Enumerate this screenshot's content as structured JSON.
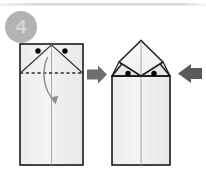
{
  "step": {
    "number": "4",
    "badge_color": "#b3b3b3",
    "badge_text_color": "#d6d6d6"
  },
  "page": {
    "background": "#ffffff",
    "rule_color": "#d8d9dd",
    "title": "Step 4 - fold top corners down"
  },
  "palette": {
    "paper_fill": "#f2f2f2",
    "paper_fill_light": "#fafafa",
    "paper_fill_shade": "#e8e8e8",
    "outline": "#1a1a1a",
    "crease": "#9a9a9a",
    "dash": "#3a3a3a",
    "dot": "#000000",
    "arrow_primary": "#6e6e6e",
    "arrow_secondary": "#5a5a5a",
    "fold_arrow": "#8a8a8a"
  },
  "left_figure": {
    "label": "before-fold",
    "description": "Rectangular paper with two diagonal creases meeting at top center, two reference dots and a horizontal dashed fold line",
    "rect": {
      "x": 20,
      "y": 44,
      "width": 63,
      "height": 121
    },
    "center_line_x": 51.5,
    "dashed_fold_line_y": 73,
    "dots": [
      {
        "cx": 38,
        "cy": 51,
        "r": 2.6
      },
      {
        "cx": 65,
        "cy": 51,
        "r": 2.6
      }
    ],
    "creases": [
      {
        "from": [
          51.5,
          44
        ],
        "to": [
          20,
          73
        ]
      },
      {
        "from": [
          51.5,
          44
        ],
        "to": [
          83,
          73
        ]
      }
    ],
    "fold_arrow": {
      "description": "curved arrow indicating downward fold",
      "from": [
        48,
        57
      ],
      "to": [
        56,
        100
      ]
    }
  },
  "right_figure": {
    "label": "after-fold",
    "description": "Result shape with a diamond shaped folded flap on top of the rectangular body and two reference dots on the lower flap corners",
    "body_rect": {
      "x": 112,
      "y": 76,
      "width": 58,
      "height": 89
    },
    "center_line_x": 141,
    "apex": [
      141,
      40
    ],
    "left_corner": [
      112,
      76
    ],
    "right_corner": [
      170,
      76
    ],
    "diamond": [
      [
        141,
        40
      ],
      [
        163,
        62
      ],
      [
        141,
        76
      ],
      [
        119,
        62
      ]
    ],
    "dots": [
      {
        "cx": 128,
        "cy": 74,
        "r": 2.6
      },
      {
        "cx": 154,
        "cy": 74,
        "r": 2.6
      }
    ]
  },
  "arrows": {
    "transition": {
      "name": "right-arrow",
      "direction": "right",
      "color": "#6e6e6e",
      "x": 87,
      "y": 66,
      "width": 20,
      "height": 18
    },
    "push": {
      "name": "left-arrow",
      "direction": "left",
      "color": "#5a5a5a",
      "x": 178,
      "y": 64,
      "width": 24,
      "height": 18
    }
  }
}
